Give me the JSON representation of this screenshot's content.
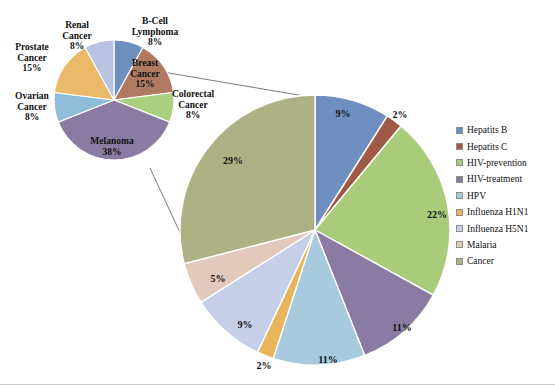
{
  "chart_data": [
    {
      "type": "pie",
      "title": "Cancer indications (exploded detail pie)",
      "name": "cancer-breakdown-pie",
      "legend_position": "labels-around-slices",
      "categories": [
        "B-Cell Lymphoma",
        "Breast Cancer",
        "Colorectal Cancer",
        "Melanoma",
        "Ovarian Cancer",
        "Prostate Cancer",
        "Renal Cancer"
      ],
      "values": [
        8,
        15,
        8,
        38,
        8,
        15,
        8
      ],
      "value_unit": "%",
      "labels": [
        {
          "name": "B-Cell Lymphoma",
          "value": 8,
          "text": "B-Cell\nLymphoma\n8%"
        },
        {
          "name": "Breast Cancer",
          "value": 15,
          "text": "Breast\nCancer\n15%"
        },
        {
          "name": "Colorectal Cancer",
          "value": 8,
          "text": "Colorectal\nCancer\n8%"
        },
        {
          "name": "Melanoma",
          "value": 38,
          "text": "Melanoma\n38%"
        },
        {
          "name": "Ovarian Cancer",
          "value": 8,
          "text": "Ovarian\nCancer\n8%"
        },
        {
          "name": "Prostate Cancer",
          "value": 15,
          "text": "Prostate\nCancer\n15%"
        },
        {
          "name": "Renal Cancer",
          "value": 8,
          "text": "Renal\nCancer\n8%"
        }
      ],
      "colors": [
        "#6f8fc0",
        "#b07a62",
        "#a9cf7f",
        "#8a7ba3",
        "#8fbcd9",
        "#eab96a",
        "#b9c4e3"
      ]
    },
    {
      "type": "pie",
      "title": "Disease areas",
      "name": "disease-area-pie",
      "legend_position": "right",
      "categories": [
        "Hepatits B",
        "Hepatits C",
        "HIV-prevention",
        "HIV-treatment",
        "HPV",
        "Influenza H1N1",
        "Influenza H5N1",
        "Malaria",
        "Cancer"
      ],
      "values": [
        9,
        2,
        22,
        11,
        11,
        2,
        9,
        5,
        29
      ],
      "value_unit": "%",
      "value_labels": [
        "9%",
        "2%",
        "22%",
        "11%",
        "11%",
        "2%",
        "9%",
        "5%",
        "29%"
      ],
      "colors": [
        "#6f8fc0",
        "#9e5a45",
        "#a8cc7a",
        "#8a7ba3",
        "#a8cadf",
        "#e8b55a",
        "#c5cfe8",
        "#e3c8bc",
        "#adb184"
      ]
    }
  ],
  "small_pie": {
    "labels": {
      "renal": "Renal\nCancer\n8%",
      "bcell": "B-Cell\nLymphoma\n8%",
      "prostate": "Prostate\nCancer\n15%",
      "breast": "Breast\nCancer\n15%",
      "ovarian": "Ovarian\nCancer\n8%",
      "colorectal": "Colorectal\nCancer\n8%",
      "melanoma": "Melanoma\n38%"
    }
  },
  "main_pie": {
    "percent_labels": {
      "hepatitis_b": "9%",
      "hepatitis_c": "2%",
      "hiv_prevention": "22%",
      "hiv_treatment": "11%",
      "hpv": "11%",
      "influenza_h1n1": "2%",
      "influenza_h5n1": "9%",
      "malaria": "5%",
      "cancer": "29%"
    }
  },
  "legend": {
    "items": [
      {
        "label": "Hepatits B",
        "color": "#6f8fc0"
      },
      {
        "label": "Hepatits C",
        "color": "#9e5a45"
      },
      {
        "label": "HIV-prevention",
        "color": "#a8cc7a"
      },
      {
        "label": "HIV-treatment",
        "color": "#8a7ba3"
      },
      {
        "label": "HPV",
        "color": "#a8cadf"
      },
      {
        "label": "Influenza H1N1",
        "color": "#e8b55a"
      },
      {
        "label": "Influenza H5N1",
        "color": "#c5cfe8"
      },
      {
        "label": "Malaria",
        "color": "#e3c8bc"
      },
      {
        "label": "Cancer",
        "color": "#adb184"
      }
    ]
  }
}
